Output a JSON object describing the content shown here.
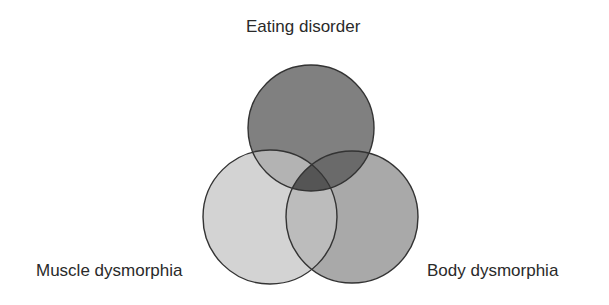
{
  "diagram": {
    "type": "venn-3",
    "sets": [
      {
        "id": "eating",
        "label": "Eating disorder",
        "position": "top",
        "cx": 311,
        "cy": 128,
        "r": 63,
        "fill": "#808080"
      },
      {
        "id": "muscle",
        "label": "Muscle dysmorphia",
        "position": "bottom-left",
        "cx": 270,
        "cy": 217,
        "r": 67,
        "fill": "#d3d3d3"
      },
      {
        "id": "body",
        "label": "Body dysmorphia",
        "position": "bottom-right",
        "cx": 352,
        "cy": 217,
        "r": 66,
        "fill": "#a9a9a9"
      }
    ],
    "intersection_colors": {
      "eating_muscle": "#b3b3b3",
      "eating_body": "#6a6a6a",
      "muscle_body": "#bcbcbc",
      "all_three": "#555555"
    },
    "stroke_color": "#333333",
    "labels": {
      "top": "Eating disorder",
      "left": "Muscle dysmorphia",
      "right": "Body dysmorphia"
    }
  }
}
